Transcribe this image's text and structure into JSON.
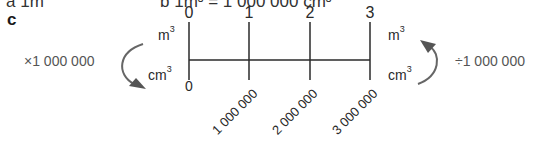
{
  "header_partial": {
    "part_a": "a 1m",
    "part_b": "b 1m³ = 1 000 000 cm³"
  },
  "part_c": {
    "label": "c",
    "top_scale": {
      "unit": "m",
      "unit_sup": "3",
      "ticks": [
        "0",
        "1",
        "2",
        "3"
      ]
    },
    "bottom_scale": {
      "unit": "cm",
      "unit_sup": "3",
      "ticks": [
        "0",
        "1 000 000",
        "2 000 000",
        "3 000 000"
      ]
    },
    "left_conversion": {
      "label": "×1 000 000",
      "direction": "m³ to cm³"
    },
    "right_conversion": {
      "label": "÷1 000 000",
      "direction": "cm³ to m³"
    },
    "colors": {
      "line": "#2a2a2a",
      "arrow": "#666666",
      "text": "#2a2a2a"
    }
  }
}
